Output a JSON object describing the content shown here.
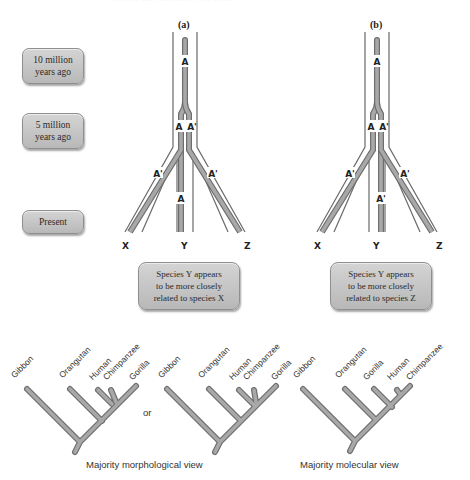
{
  "header": {
    "cut_text": "··· ·· ··· ····· ··· ······ ·· ···· ··· ···"
  },
  "time_scale": [
    {
      "label_line1": "10 million",
      "label_line2": "years ago"
    },
    {
      "label_line1": "5 million",
      "label_line2": "years ago"
    },
    {
      "label_line1": "Present",
      "label_line2": ""
    }
  ],
  "panels": [
    {
      "label": "(a)",
      "tips": [
        "X",
        "Y",
        "Z"
      ],
      "gene_labels": {
        "root": "A",
        "split_left": "A",
        "split_right": "A'",
        "x_branch": "A'",
        "y_branch": "A",
        "z_branch": "A'"
      },
      "result": [
        "Species Y appears",
        "to be more closely",
        "related to species X"
      ]
    },
    {
      "label": "(b)",
      "tips": [
        "X",
        "Y",
        "Z"
      ],
      "gene_labels": {
        "root": "A",
        "split_left": "A",
        "split_right": "A'",
        "x_branch": "A'",
        "y_branch": "A'",
        "z_branch": "A'"
      },
      "result": [
        "Species Y appears",
        "to be more closely",
        "related to species Z"
      ]
    }
  ],
  "cladograms": [
    {
      "taxa": [
        "Gibbon",
        "Orangutan",
        "Human",
        "Chimpanzee",
        "Gorilla"
      ]
    },
    {
      "taxa": [
        "Gibbon",
        "Orangutan",
        "Human",
        "Chimpanzee",
        "Gorilla"
      ]
    },
    {
      "taxa": [
        "Gibbon",
        "Orangutan",
        "Gorilla",
        "Human",
        "Chimpanzee"
      ]
    }
  ],
  "connector": "or",
  "captions": {
    "morphological": "Majority morphological view",
    "molecular": "Majority molecular view"
  },
  "colors": {
    "branch": "#9a9a9a",
    "branch_edge": "#6e6e6e",
    "outline": "#666666",
    "box_fill": "#c6c6c6"
  }
}
